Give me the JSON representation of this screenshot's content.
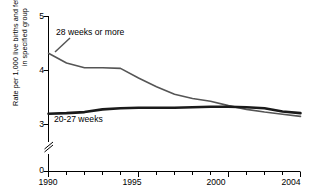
{
  "chart_data": {
    "type": "line",
    "title": "",
    "xlabel": "",
    "ylabel": "Rate per 1,000 live births and fetal deaths in specified group",
    "ylabel_lines": [
      "Rate per 1,000 live births and fetal deaths",
      "in specified group"
    ],
    "xlim": [
      1990,
      2004
    ],
    "ylim": [
      3.0,
      5.0
    ],
    "y_axis_break": true,
    "y_break_note": "axis broken between 0 and 3",
    "grid": false,
    "legend_position": "inline-labels",
    "yticks": [
      "0",
      "3",
      "4",
      "5"
    ],
    "ytick_values": [
      0,
      3,
      4,
      5
    ],
    "xticks": [
      "1990",
      "1995",
      "2000",
      "2004"
    ],
    "xtick_values": [
      1990,
      1995,
      2000,
      2004
    ],
    "x_minor_ticks": [
      1991,
      1992,
      1993,
      1994,
      1996,
      1997,
      1998,
      1999,
      2001,
      2002,
      2003
    ],
    "x": [
      1990,
      1991,
      1992,
      1993,
      1994,
      1995,
      1996,
      1997,
      1998,
      1999,
      2000,
      2001,
      2002,
      2003,
      2004
    ],
    "series": [
      {
        "name": "28 weeks or more",
        "label": "28 weeks or more",
        "color": "#555555",
        "linewidth": 1.6,
        "values": [
          4.32,
          4.14,
          4.05,
          4.05,
          4.04,
          3.86,
          3.7,
          3.56,
          3.48,
          3.43,
          3.35,
          3.28,
          3.23,
          3.19,
          3.15
        ]
      },
      {
        "name": "20-27 weeks",
        "label": "20-27 weeks",
        "color": "#1a1a1a",
        "linewidth": 2.6,
        "values": [
          3.2,
          3.21,
          3.23,
          3.28,
          3.3,
          3.31,
          3.31,
          3.31,
          3.32,
          3.33,
          3.33,
          3.32,
          3.3,
          3.24,
          3.21
        ]
      }
    ]
  }
}
